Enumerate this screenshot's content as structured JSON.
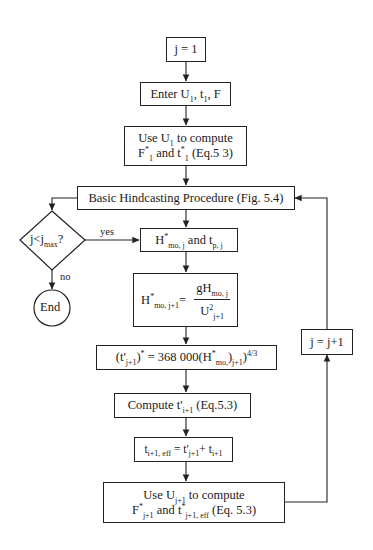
{
  "flowchart": {
    "start": {
      "text": "j = 1"
    },
    "enter": {
      "prefix": "Enter U",
      "sub1": "1",
      "mid": ", t",
      "sub2": "1",
      "suffix": ", F"
    },
    "use_u1": {
      "line1_prefix": "Use U",
      "line1_sub": "1",
      "line1_suffix": " to compute",
      "line2_a": "F",
      "line2_sup_a": "*",
      "line2_sub_a": "1",
      "line2_b": " and t",
      "line2_sup_b": "*",
      "line2_sub_b": "1",
      "line2_suffix": " (Eq.5 3)"
    },
    "basic": {
      "text": "Basic Hindcasting Procedure (Fig. 5.4)"
    },
    "decision": {
      "text": "j<j",
      "sub": "max",
      "suffix": "?"
    },
    "yes_label": "yes",
    "no_label": "no",
    "end": {
      "text": "End"
    },
    "hmo": {
      "a": "H",
      "sup": "*",
      "sub": "mo, j",
      "mid": " and t",
      "sub2": "p, j"
    },
    "formula": {
      "lhs": "H",
      "lhs_sup": "*",
      "lhs_sub": "mo, j+1",
      "eq": "=",
      "num": "gH",
      "num_sub": "mo, j",
      "den": "U",
      "den_sup": "2",
      "den_sub": "j+1"
    },
    "tprime": {
      "a": "(t'",
      "sub1": "j+1",
      "b": ")",
      "sup1": "*",
      "c": " = 368 000(H",
      "sup2": "*",
      "sub2": "mo,",
      "d": ")",
      "sub3": "j+1",
      "e": ")",
      "sup3": "4/3"
    },
    "compute": {
      "a": "Compute t'",
      "sub": "i+1",
      "b": " (Eq.5.3)"
    },
    "teff": {
      "a": "t",
      "sub1": "i+1, eff",
      "b": " = t'",
      "sub2": "j+1",
      "c": "+ t",
      "sub3": "i+1"
    },
    "use_uj": {
      "line1_prefix": "Use U",
      "line1_sub": "j+1",
      "line1_suffix": " to compute",
      "line2_a": "F",
      "line2_sup_a": "*",
      "line2_sub_a": "j+1",
      "line2_b": " and t",
      "line2_sup_b": "*",
      "line2_sub_b": "j+1, eff",
      "line2_suffix": "  (Eq. 5.3)"
    },
    "increment": {
      "text": "j = j+1"
    }
  }
}
